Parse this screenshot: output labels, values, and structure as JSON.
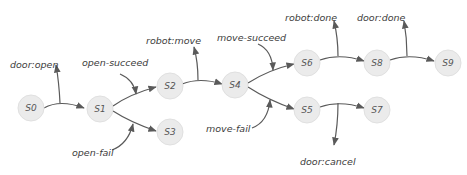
{
  "diagram": {
    "nodes": [
      {
        "id": "S0",
        "label": "S0"
      },
      {
        "id": "S1",
        "label": "S1"
      },
      {
        "id": "S2",
        "label": "S2"
      },
      {
        "id": "S3",
        "label": "S3"
      },
      {
        "id": "S4",
        "label": "S4"
      },
      {
        "id": "S5",
        "label": "S5"
      },
      {
        "id": "S6",
        "label": "S6"
      },
      {
        "id": "S7",
        "label": "S7"
      },
      {
        "id": "S8",
        "label": "S8"
      },
      {
        "id": "S9",
        "label": "S9"
      }
    ],
    "events": {
      "door_open": "door:open",
      "open_succeed": "open-succeed",
      "open_fail": "open-fail",
      "robot_move": "robot:move",
      "move_succeed": "move-succeed",
      "move_fail": "move-fail",
      "robot_done": "robot:done",
      "door_done": "door:done",
      "door_cancel": "door:cancel"
    },
    "edges": [
      {
        "from": "S0",
        "to": "S1"
      },
      {
        "from": "S1",
        "to": "S2"
      },
      {
        "from": "S1",
        "to": "S3"
      },
      {
        "from": "S2",
        "to": "S4"
      },
      {
        "from": "S4",
        "to": "S6"
      },
      {
        "from": "S4",
        "to": "S5"
      },
      {
        "from": "S6",
        "to": "S8"
      },
      {
        "from": "S8",
        "to": "S9"
      },
      {
        "from": "S5",
        "to": "S7"
      }
    ]
  }
}
